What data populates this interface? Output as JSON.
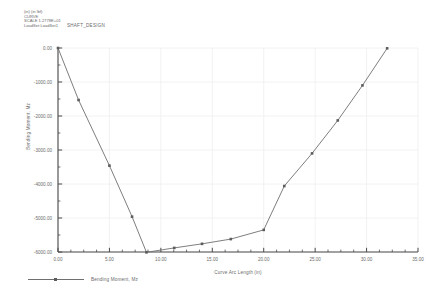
{
  "header": {
    "lines": [
      "(in) (in lbf)",
      "CURVE",
      "SCALE  1.2778E+01"
    ],
    "loadset_line": "LoadSet:LoadSet1",
    "title": "SHAFT_DESIGN"
  },
  "chart_data": {
    "type": "line",
    "title": "SHAFT_DESIGN",
    "xlabel": "Curve Arc Length (in)",
    "ylabel": "Bending Moment, Mz",
    "xlim": [
      0,
      35
    ],
    "ylim": [
      -6000,
      0
    ],
    "xticks": [
      "0.00",
      "5.00",
      "10.00",
      "15.00",
      "20.00",
      "25.00",
      "30.00",
      "35.00"
    ],
    "xtick_values": [
      0,
      5,
      10,
      15,
      20,
      25,
      30,
      35
    ],
    "yticks": [
      "0.00",
      "-1000.00",
      "-2000.00",
      "-3000.00",
      "-4000.00",
      "-5000.00",
      "-6000.00"
    ],
    "ytick_values": [
      0,
      -1000,
      -2000,
      -3000,
      -4000,
      -5000,
      -6000
    ],
    "x_minor_step": 1.25,
    "y_minor_step": 500,
    "grid": true,
    "legend_position": "bottom-left",
    "series": [
      {
        "name": "Bending Moment, Mz",
        "color": "#6f6f6f",
        "marker": "square",
        "x": [
          0.0,
          2.0,
          5.0,
          7.2,
          8.6,
          11.3,
          14.0,
          16.8,
          20.0,
          22.0,
          24.7,
          27.2,
          29.6,
          32.0
        ],
        "y": [
          0,
          -1530,
          -3460,
          -4960,
          -6010,
          -5880,
          -5760,
          -5620,
          -5350,
          -4060,
          -3100,
          -2130,
          -1100,
          -10
        ]
      }
    ]
  },
  "legend": {
    "label": "Bending Moment, Mz"
  },
  "colors": {
    "curve": "#6f6f6f",
    "marker": "#5c5c5c",
    "axis": "#4a4a4a",
    "grid": "#efefef",
    "text": "#6b6b6b"
  }
}
